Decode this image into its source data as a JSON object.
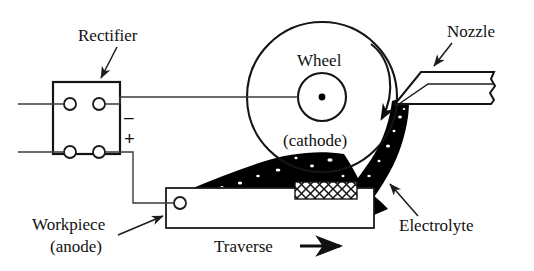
{
  "figure": {
    "background_color": "#ffffff",
    "ink_color": "#111111"
  },
  "labels": {
    "rectifier": "Rectifier",
    "wheel": "Wheel",
    "cathode": "(cathode)",
    "nozzle": "Nozzle",
    "electrolyte": "Electrolyte",
    "workpiece": "Workpiece",
    "anode": "(anode)",
    "traverse": "Traverse",
    "negative_sign": "–",
    "positive_sign": "+"
  },
  "components": {
    "rectifier_box": {
      "name": "rectifier",
      "terminal_count": 4,
      "output_negative": "–",
      "output_positive": "+"
    },
    "grinding_wheel": {
      "name": "wheel",
      "polarity": "cathode",
      "rotation": "clockwise",
      "has_hub": true,
      "has_center_dot": true
    },
    "nozzle": {
      "name": "nozzle",
      "broken_edge": true
    },
    "electrolyte": {
      "name": "electrolyte",
      "fill": "#000000",
      "speckled": true
    },
    "workpiece": {
      "name": "workpiece",
      "polarity": "anode",
      "motion": "Traverse",
      "motion_direction": "right",
      "has_grinding_gap": true
    }
  }
}
